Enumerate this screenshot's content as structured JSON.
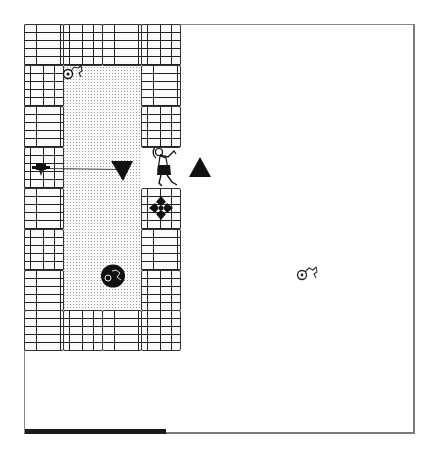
{
  "game": {
    "view": "top-down dungeon",
    "colors": {
      "background": "#ffffff",
      "frame_border": "#7a7a7a",
      "brick_mortar": "#222222",
      "floor_dots": "#9a9a9a",
      "health_bar": "#1a1a1a"
    },
    "walls": [
      {
        "name": "top-row",
        "x": 24,
        "y": 24,
        "w": 157,
        "h": 42
      },
      {
        "name": "left-column",
        "x": 24,
        "y": 66,
        "w": 39,
        "h": 244
      },
      {
        "name": "right-column-upper",
        "x": 141,
        "y": 66,
        "w": 40,
        "h": 82
      },
      {
        "name": "right-column-lower",
        "x": 141,
        "y": 188,
        "w": 40,
        "h": 122
      },
      {
        "name": "bottom-row",
        "x": 24,
        "y": 310,
        "w": 157,
        "h": 41
      }
    ],
    "floor": {
      "x": 63,
      "y": 66,
      "w": 78,
      "h": 244
    },
    "sprites": [
      {
        "name": "rope-coil-item",
        "x": 63,
        "y": 66
      },
      {
        "name": "arrow-trap",
        "x": 33,
        "y": 160
      },
      {
        "name": "dark-down-triangle-marker",
        "x": 112,
        "y": 160
      },
      {
        "name": "adventurer-player",
        "x": 150,
        "y": 146
      },
      {
        "name": "dark-up-triangle-marker",
        "x": 189,
        "y": 157
      },
      {
        "name": "diamond-cross-ornament",
        "x": 149,
        "y": 196
      },
      {
        "name": "boulder-with-rope",
        "x": 101,
        "y": 264
      },
      {
        "name": "rope-coil-item-outside",
        "x": 298,
        "y": 266
      }
    ],
    "health_bar": {
      "x": 25,
      "y": 429,
      "width": 141,
      "height": 5,
      "max_width": 390
    }
  }
}
